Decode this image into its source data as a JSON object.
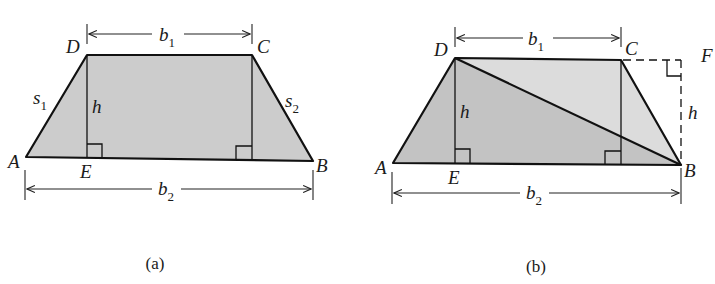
{
  "figure": {
    "panels": [
      {
        "id": "a",
        "caption": "(a)",
        "fill": "#cccccc",
        "vertices": {
          "A": "A",
          "B": "B",
          "C": "C",
          "D": "D",
          "E": "E"
        },
        "labels": {
          "b1_main": "b",
          "b1_sub": "1",
          "b2_main": "b",
          "b2_sub": "2",
          "s1_main": "s",
          "s1_sub": "1",
          "s2_main": "s",
          "s2_sub": "2",
          "h": "h"
        }
      },
      {
        "id": "b",
        "caption": "(b)",
        "fill_lower": "#c3c3c3",
        "fill_upper": "#dcdcdc",
        "vertices": {
          "A": "A",
          "B": "B",
          "C": "C",
          "D": "D",
          "E": "E",
          "F": "F"
        },
        "labels": {
          "b1_main": "b",
          "b1_sub": "1",
          "b2_main": "b",
          "b2_sub": "2",
          "h_inner": "h",
          "h_outer": "h"
        }
      }
    ]
  }
}
